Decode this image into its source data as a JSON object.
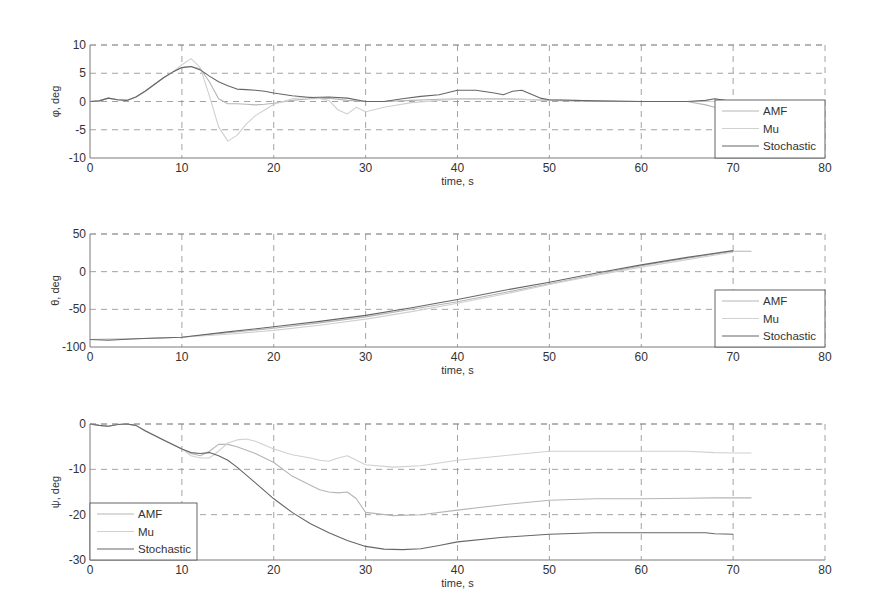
{
  "figure": {
    "width": 871,
    "height": 614,
    "background": "#ffffff",
    "axis_color": "#7a7a7a",
    "grid_color": "#8c8c8c",
    "text_color": "#333333"
  },
  "chart_data": [
    {
      "type": "line",
      "title": "",
      "xlabel": "time, s",
      "ylabel": "φ, deg",
      "xlim": [
        0,
        80
      ],
      "ylim": [
        -10,
        10
      ],
      "xticks": [
        0,
        10,
        20,
        30,
        40,
        50,
        60,
        70,
        80
      ],
      "yticks": [
        -10,
        -5,
        0,
        5,
        10
      ],
      "grid": true,
      "legend_position": "lower right",
      "layout": {
        "left": 90,
        "top": 45,
        "right": 825,
        "bottom": 158
      },
      "legend_box": {
        "x": 715,
        "y": 100,
        "w": 110,
        "h": 58
      },
      "series": [
        {
          "name": "AMF",
          "color": "#b5b5b5",
          "x": [
            0,
            1,
            2,
            3,
            4,
            5,
            6,
            7,
            8,
            9,
            10,
            11,
            12,
            13,
            14,
            15,
            16,
            17,
            18,
            19,
            20,
            22,
            24,
            26,
            28,
            30,
            32,
            35,
            38,
            40,
            45,
            50,
            55,
            60,
            65,
            67,
            68,
            69,
            70,
            75,
            80
          ],
          "y": [
            0,
            0.1,
            0.6,
            0.3,
            0.2,
            0.8,
            1.8,
            3.0,
            4.2,
            5.2,
            6.0,
            6.2,
            5.8,
            3.5,
            0.5,
            -0.4,
            -0.4,
            -0.5,
            -0.6,
            -0.5,
            -0.3,
            0.2,
            0.5,
            0.6,
            0.2,
            0.0,
            0.0,
            0.2,
            0.4,
            0.5,
            0.5,
            0.2,
            0.0,
            0.0,
            0.0,
            -0.6,
            -1.0,
            -0.3,
            0.0,
            0.0,
            0.0
          ]
        },
        {
          "name": "Mu",
          "color": "#d0d0d0",
          "x": [
            0,
            1,
            2,
            3,
            4,
            5,
            6,
            7,
            8,
            9,
            10,
            11,
            12,
            13,
            14,
            15,
            16,
            17,
            18,
            19,
            20,
            22,
            24,
            26,
            27,
            28,
            29,
            30,
            32,
            35,
            38,
            40,
            45,
            50,
            55,
            60,
            65,
            70,
            75,
            80
          ],
          "y": [
            0,
            0.1,
            0.6,
            0.3,
            0.2,
            0.8,
            1.8,
            3.0,
            4.2,
            5.2,
            6.5,
            7.6,
            6.0,
            1.0,
            -4.5,
            -7.0,
            -6.0,
            -4.0,
            -2.5,
            -1.5,
            -0.5,
            0.5,
            0.8,
            0.2,
            -1.5,
            -2.2,
            -1.0,
            -1.8,
            -1.0,
            -0.2,
            0.2,
            0.4,
            0.4,
            0.3,
            0.1,
            0.0,
            0.0,
            0.0,
            0.0,
            0.0
          ]
        },
        {
          "name": "Stochastic",
          "color": "#666666",
          "x": [
            0,
            1,
            2,
            3,
            4,
            5,
            6,
            7,
            8,
            9,
            10,
            11,
            12,
            13,
            14,
            15,
            16,
            17,
            18,
            19,
            20,
            22,
            24,
            26,
            28,
            30,
            32,
            34,
            36,
            38,
            40,
            42,
            44,
            45,
            46,
            47,
            49,
            50,
            55,
            60,
            65,
            67,
            68,
            70,
            75,
            80
          ],
          "y": [
            0,
            0.1,
            0.6,
            0.3,
            0.2,
            0.8,
            1.8,
            3.0,
            4.2,
            5.2,
            6.0,
            6.2,
            5.6,
            4.5,
            3.5,
            2.8,
            2.2,
            2.1,
            2.0,
            1.8,
            1.5,
            1.0,
            0.7,
            0.8,
            0.6,
            0.0,
            0.0,
            0.5,
            0.9,
            1.2,
            2.0,
            2.0,
            1.5,
            1.2,
            1.8,
            2.0,
            0.6,
            0.3,
            0.1,
            0.0,
            0.0,
            0.2,
            0.5,
            0.0,
            0.0,
            0.0
          ]
        }
      ]
    },
    {
      "type": "line",
      "title": "",
      "xlabel": "time, s",
      "ylabel": "θ, deg",
      "xlim": [
        0,
        80
      ],
      "ylim": [
        -100,
        50
      ],
      "xticks": [
        0,
        10,
        20,
        30,
        40,
        50,
        60,
        70,
        80
      ],
      "yticks": [
        -100,
        -50,
        0,
        50
      ],
      "grid": true,
      "legend_position": "lower right",
      "layout": {
        "left": 90,
        "top": 234,
        "right": 825,
        "bottom": 347
      },
      "legend_box": {
        "x": 715,
        "y": 290,
        "w": 110,
        "h": 57
      },
      "series": [
        {
          "name": "AMF",
          "color": "#b5b5b5",
          "x": [
            0,
            5,
            10,
            15,
            20,
            25,
            30,
            35,
            40,
            45,
            50,
            55,
            60,
            65,
            70,
            72
          ],
          "y": [
            -90,
            -89,
            -87,
            -81,
            -75,
            -68,
            -60,
            -50,
            -40,
            -28,
            -16,
            -4,
            8,
            18,
            27,
            27
          ]
        },
        {
          "name": "Mu",
          "color": "#d0d0d0",
          "x": [
            0,
            5,
            10,
            15,
            20,
            25,
            30,
            35,
            40,
            45,
            50,
            55,
            60,
            65,
            70
          ],
          "y": [
            -90,
            -89,
            -87,
            -83,
            -78,
            -71,
            -63,
            -53,
            -42,
            -30,
            -17,
            -5,
            6,
            16,
            26
          ]
        },
        {
          "name": "Stochastic",
          "color": "#666666",
          "x": [
            0,
            2,
            5,
            10,
            15,
            20,
            25,
            30,
            35,
            40,
            45,
            50,
            55,
            60,
            65,
            70
          ],
          "y": [
            -90,
            -91,
            -89,
            -87,
            -80,
            -73,
            -66,
            -58,
            -48,
            -37,
            -25,
            -14,
            -2,
            9,
            19,
            28
          ]
        }
      ]
    },
    {
      "type": "line",
      "title": "",
      "xlabel": "time, s",
      "ylabel": "ψ, deg",
      "xlim": [
        0,
        80
      ],
      "ylim": [
        -30,
        0
      ],
      "xticks": [
        0,
        10,
        20,
        30,
        40,
        50,
        60,
        70,
        80
      ],
      "yticks": [
        -30,
        -20,
        -10,
        0
      ],
      "grid": true,
      "legend_position": "lower left",
      "layout": {
        "left": 90,
        "top": 424,
        "right": 825,
        "bottom": 560
      },
      "legend_box": {
        "x": 90,
        "y": 503,
        "w": 107,
        "h": 57
      },
      "series": [
        {
          "name": "AMF",
          "color": "#b5b5b5",
          "x": [
            0,
            1,
            2,
            3,
            4,
            5,
            6,
            8,
            10,
            11,
            12,
            13,
            14,
            15,
            16,
            18,
            20,
            22,
            24,
            25,
            26,
            27,
            28,
            29,
            30,
            33,
            36,
            40,
            45,
            50,
            55,
            60,
            65,
            68,
            70,
            72
          ],
          "y": [
            0,
            -0.3,
            -0.5,
            -0.1,
            0,
            -0.3,
            -1.5,
            -3.5,
            -5.5,
            -6.5,
            -7.0,
            -6.0,
            -4.5,
            -4.5,
            -5.0,
            -6.5,
            -8.5,
            -11.5,
            -13.5,
            -14.5,
            -15.0,
            -15.2,
            -15.0,
            -16.5,
            -19.5,
            -20.2,
            -20.0,
            -19.0,
            -17.8,
            -16.8,
            -16.5,
            -16.5,
            -16.4,
            -16.3,
            -16.3,
            -16.3
          ]
        },
        {
          "name": "Mu",
          "color": "#d0d0d0",
          "x": [
            0,
            1,
            2,
            3,
            4,
            5,
            6,
            8,
            10,
            11,
            12,
            13,
            14,
            15,
            16,
            17,
            18,
            20,
            22,
            24,
            25,
            26,
            27,
            28,
            29,
            30,
            33,
            36,
            40,
            45,
            50,
            55,
            60,
            65,
            68,
            70,
            72
          ],
          "y": [
            0,
            -0.3,
            -0.5,
            -0.1,
            0,
            -0.3,
            -1.5,
            -3.5,
            -5.5,
            -7.0,
            -7.5,
            -7.5,
            -6.0,
            -4.2,
            -3.5,
            -3.3,
            -3.8,
            -5.5,
            -6.8,
            -7.5,
            -8.0,
            -8.2,
            -7.5,
            -7.0,
            -8.0,
            -9.0,
            -9.5,
            -9.2,
            -8.0,
            -7.0,
            -6.0,
            -6.0,
            -6.0,
            -6.0,
            -6.3,
            -6.4,
            -6.4
          ]
        },
        {
          "name": "Stochastic",
          "color": "#666666",
          "x": [
            0,
            1,
            2,
            3,
            4,
            5,
            6,
            8,
            10,
            11,
            12,
            13,
            14,
            15,
            16,
            18,
            20,
            22,
            24,
            26,
            28,
            30,
            32,
            34,
            36,
            38,
            40,
            45,
            50,
            55,
            60,
            65,
            67,
            68,
            70
          ],
          "y": [
            0,
            -0.3,
            -0.5,
            -0.1,
            0,
            -0.3,
            -1.5,
            -3.5,
            -5.5,
            -6.3,
            -6.5,
            -6.3,
            -7.0,
            -8.0,
            -9.5,
            -13.0,
            -16.5,
            -19.5,
            -22.0,
            -24.0,
            -25.7,
            -27.0,
            -27.6,
            -27.7,
            -27.5,
            -26.8,
            -26.0,
            -25.0,
            -24.3,
            -24.0,
            -24.0,
            -24.0,
            -24.0,
            -24.2,
            -24.3
          ]
        }
      ]
    }
  ]
}
